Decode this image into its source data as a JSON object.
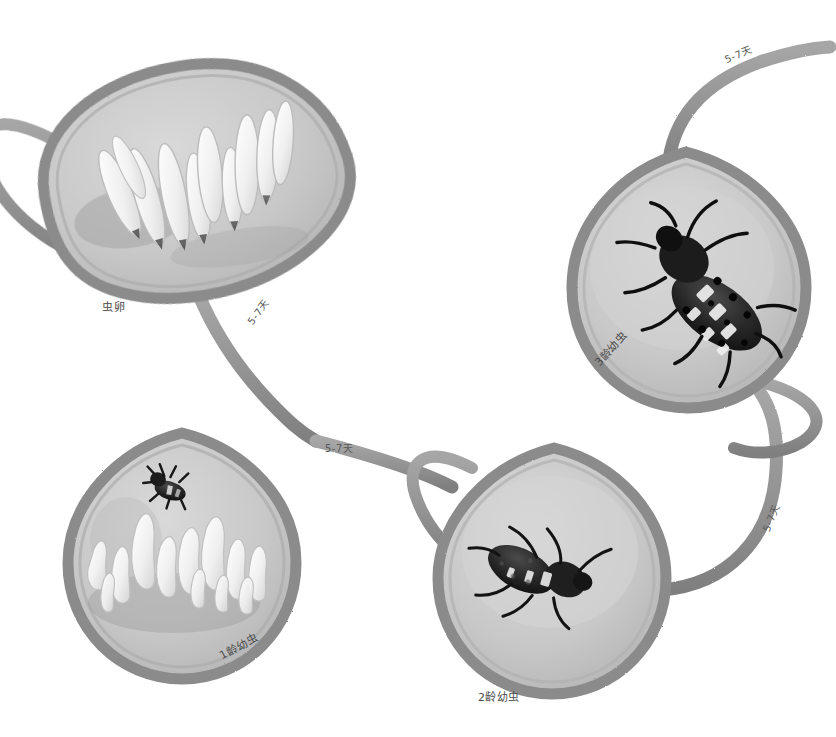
{
  "diagram": {
    "style": "hand-painted watercolor, grayscale",
    "colors": {
      "background": "#ffffff",
      "leaf_fill": "#c6c6c6",
      "leaf_fill_light": "#d2d2d2",
      "leaf_border": "#8e8e8e",
      "stem": "#9a9a9a",
      "stem_dark": "#7d7d7d",
      "egg_white": "#f2f2f2",
      "larva_dark": "#2a2a2a",
      "label_text": "#4a4a4a"
    },
    "stages": [
      {
        "id": "eggs",
        "label": "虫卵",
        "label_position": "below-left",
        "contents": "cluster of upright white spindle-shaped eggs",
        "egg_count": 10,
        "leaf": {
          "cx": 190,
          "cy": 190,
          "rx": 140,
          "ry": 115,
          "rotation": -8
        },
        "label_x": 102,
        "label_y": 298,
        "label_rotate": 0
      },
      {
        "id": "instar-1",
        "label": "1龄幼虫",
        "label_position": "below-right",
        "contents": "hatched egg shells and one tiny dark first-instar larva",
        "egg_count": 12,
        "leaf": {
          "cx": 180,
          "cy": 555,
          "rx": 112,
          "ry": 122,
          "rotation": 0
        },
        "label_x": 216,
        "label_y": 648,
        "label_rotate": -28
      },
      {
        "id": "instar-2",
        "label": "2龄幼虫",
        "label_position": "below-center",
        "contents": "single medium dark second-instar larva",
        "leaf": {
          "cx": 550,
          "cy": 570,
          "rx": 112,
          "ry": 122,
          "rotation": 0
        },
        "label_x": 478,
        "label_y": 688,
        "label_rotate": 0
      },
      {
        "id": "instar-3",
        "label": "3龄幼虫",
        "label_position": "below-left",
        "contents": "single large dark third-instar larva with pale tubercles",
        "leaf": {
          "cx": 690,
          "cy": 278,
          "rx": 115,
          "ry": 122,
          "rotation": 0
        },
        "label_x": 590,
        "label_y": 358,
        "label_rotate": -48
      }
    ],
    "transitions": [
      {
        "id": "eggs-to-instar1",
        "label": "5-7天",
        "x": 243,
        "y": 318,
        "rotate": -52,
        "from": "eggs",
        "to": "instar-1"
      },
      {
        "id": "instar1-to-instar2",
        "label": "5-7天",
        "x": 325,
        "y": 440,
        "rotate": 0,
        "from": "instar-1",
        "to": "instar-2"
      },
      {
        "id": "instar2-to-instar3",
        "label": "5-7天",
        "x": 758,
        "y": 528,
        "rotate": -68,
        "from": "instar-2",
        "to": "instar-3"
      },
      {
        "id": "instar3-to-eggs",
        "label": "5-7天",
        "x": 722,
        "y": 52,
        "rotate": -22,
        "from": "instar-3",
        "to": "eggs"
      }
    ]
  }
}
